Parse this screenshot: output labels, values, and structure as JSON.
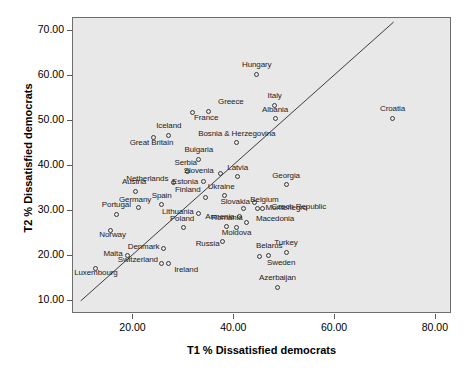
{
  "chart_data": {
    "type": "scatter",
    "title": "",
    "xlabel": "T1 % Dissatisfied democrats",
    "ylabel": "T2 % Dissatisfied democrats",
    "xlim": [
      8.0,
      83.2
    ],
    "ylim": [
      7.0,
      72.9
    ],
    "xticks": [
      20.0,
      40.0,
      60.0,
      80.0
    ],
    "yticks": [
      10.0,
      20.0,
      30.0,
      40.0,
      50.0,
      60.0,
      70.0
    ],
    "xtick_labels": [
      "20.00",
      "40.00",
      "60.00",
      "80.00"
    ],
    "ytick_labels": [
      "10.00",
      "20.00",
      "30.00",
      "40.00",
      "50.00",
      "60.00",
      "70.00"
    ],
    "grid": false,
    "legend": "none",
    "plot_background": "#e8e8e8",
    "marker_color": "#3a3a3a",
    "reference_line": {
      "type": "identity",
      "label": "y = x",
      "from": [
        9.5,
        9.5
      ],
      "to": [
        72.0,
        72.0
      ],
      "color": "#3a3a3a"
    },
    "points": [
      {
        "name": "Hungary",
        "x": 44.5,
        "y": 60.4,
        "label_dx": 0,
        "label_dy": -10,
        "label_align": "center"
      },
      {
        "name": "Italy",
        "x": 48.0,
        "y": 53.5,
        "label_dx": 0,
        "label_dy": -10,
        "label_align": "center"
      },
      {
        "name": "Greece",
        "x": 34.8,
        "y": 52.1,
        "label_dx": 6,
        "label_dy": -10,
        "label_align": "left"
      },
      {
        "name": "Albania",
        "x": 48.1,
        "y": 50.5,
        "label_dx": 0,
        "label_dy": -10,
        "label_align": "center"
      },
      {
        "name": "France",
        "x": 31.8,
        "y": 51.8,
        "label_dx": -3,
        "label_dy": 4,
        "label_align": "left"
      },
      {
        "name": "Croatia",
        "x": 71.4,
        "y": 50.6,
        "label_dx": 0,
        "label_dy": -10,
        "label_align": "center"
      },
      {
        "name": "Bosnia & Herzegovina",
        "x": 40.5,
        "y": 45.1,
        "label_dx": 0,
        "label_dy": -10,
        "label_align": "center"
      },
      {
        "name": "Iceland",
        "x": 27.0,
        "y": 46.8,
        "label_dx": 0,
        "label_dy": -10,
        "label_align": "center"
      },
      {
        "name": "Great Britain",
        "x": 24.0,
        "y": 46.2,
        "label_dx": -2,
        "label_dy": 4,
        "label_align": "center"
      },
      {
        "name": "Bulgaria",
        "x": 33.0,
        "y": 41.5,
        "label_dx": 0,
        "label_dy": -10,
        "label_align": "center"
      },
      {
        "name": "Serbia",
        "x": 30.8,
        "y": 38.7,
        "label_dx": -2,
        "label_dy": -10,
        "label_align": "center"
      },
      {
        "name": "Slovenia",
        "x": 37.3,
        "y": 38.2,
        "label_dx": -7,
        "label_dy": -4,
        "label_align": "right"
      },
      {
        "name": "Latvia",
        "x": 40.7,
        "y": 37.6,
        "label_dx": 0,
        "label_dy": -10,
        "label_align": "center"
      },
      {
        "name": "Netherlands",
        "x": 27.9,
        "y": 36.3,
        "label_dx": -5,
        "label_dy": -4,
        "label_align": "right"
      },
      {
        "name": "Estonia",
        "x": 33.8,
        "y": 36.4,
        "label_dx": -5,
        "label_dy": -1,
        "label_align": "right"
      },
      {
        "name": "Georgia",
        "x": 50.3,
        "y": 35.8,
        "label_dx": 0,
        "label_dy": -10,
        "label_align": "center"
      },
      {
        "name": "Austria",
        "x": 20.5,
        "y": 34.3,
        "label_dx": -2,
        "label_dy": -10,
        "label_align": "center"
      },
      {
        "name": "Finland",
        "x": 34.2,
        "y": 32.9,
        "label_dx": -4,
        "label_dy": -9,
        "label_align": "right"
      },
      {
        "name": "Ukraine",
        "x": 38.0,
        "y": 33.4,
        "label_dx": -3,
        "label_dy": -9,
        "label_align": "center"
      },
      {
        "name": "Slovakia",
        "x": 44.0,
        "y": 31.8,
        "label_dx": -5,
        "label_dy": -2,
        "label_align": "right"
      },
      {
        "name": "Czech Republic",
        "x": 45.6,
        "y": 30.4,
        "label_dx": 5,
        "label_dy": -3,
        "label_align": "left"
      },
      {
        "name": "Spain",
        "x": 25.6,
        "y": 31.3,
        "label_dx": 0,
        "label_dy": -10,
        "label_align": "center"
      },
      {
        "name": "Germany",
        "x": 20.9,
        "y": 30.7,
        "label_dx": -3,
        "label_dy": -9,
        "label_align": "center"
      },
      {
        "name": "Portugal",
        "x": 16.6,
        "y": 29.2,
        "label_dx": 0,
        "label_dy": -10,
        "label_align": "center"
      },
      {
        "name": "Belgium",
        "x": 41.8,
        "y": 30.4,
        "label_dx": 3,
        "label_dy": -10,
        "label_align": "left"
      },
      {
        "name": "Montenegro",
        "x": 44.6,
        "y": 30.4,
        "label_dx": 4,
        "label_dy": -2,
        "label_align": "left"
      },
      {
        "name": "Lithuania",
        "x": 33.0,
        "y": 29.4,
        "label_dx": -5,
        "label_dy": -2,
        "label_align": "right"
      },
      {
        "name": "Armenia",
        "x": 41.0,
        "y": 28.6,
        "label_dx": -5,
        "label_dy": -1,
        "label_align": "right"
      },
      {
        "name": "Macedonia",
        "x": 42.5,
        "y": 27.4,
        "label_dx": 5,
        "label_dy": -4,
        "label_align": "left"
      },
      {
        "name": "Romania",
        "x": 38.5,
        "y": 26.4,
        "label_dx": 0,
        "label_dy": -10,
        "label_align": "center"
      },
      {
        "name": "Poland",
        "x": 30.0,
        "y": 26.2,
        "label_dx": -2,
        "label_dy": -10,
        "label_align": "center"
      },
      {
        "name": "Norway",
        "x": 15.5,
        "y": 25.7,
        "label_dx": 2,
        "label_dy": 4,
        "label_align": "center"
      },
      {
        "name": "Moldova",
        "x": 40.5,
        "y": 26.2,
        "label_dx": 0,
        "label_dy": 4,
        "label_align": "center"
      },
      {
        "name": "Russia",
        "x": 37.7,
        "y": 23.1,
        "label_dx": -3,
        "label_dy": 1,
        "label_align": "right"
      },
      {
        "name": "Denmark",
        "x": 26.0,
        "y": 21.6,
        "label_dx": -4,
        "label_dy": -2,
        "label_align": "right"
      },
      {
        "name": "Turkey",
        "x": 50.3,
        "y": 20.8,
        "label_dx": 0,
        "label_dy": -10,
        "label_align": "center"
      },
      {
        "name": "Belarus",
        "x": 46.7,
        "y": 20.1,
        "label_dx": 1,
        "label_dy": -10,
        "label_align": "center"
      },
      {
        "name": "Malta",
        "x": 18.8,
        "y": 20.0,
        "label_dx": -5,
        "label_dy": -3,
        "label_align": "right"
      },
      {
        "name": "Sweden",
        "x": 45.1,
        "y": 19.8,
        "label_dx": 3,
        "label_dy": 5,
        "label_align": "left"
      },
      {
        "name": "Switzerland",
        "x": 25.6,
        "y": 18.2,
        "label_dx": -4,
        "label_dy": -5,
        "label_align": "right"
      },
      {
        "name": "Ireland",
        "x": 26.9,
        "y": 18.2,
        "label_dx": 2,
        "label_dy": 5,
        "label_align": "left"
      },
      {
        "name": "Luxembourg",
        "x": 12.5,
        "y": 17.2,
        "label_dx": 0,
        "label_dy": 4,
        "label_align": "center"
      },
      {
        "name": "Azerbaijan",
        "x": 48.6,
        "y": 13.0,
        "label_dx": 0,
        "label_dy": -10,
        "label_align": "center"
      }
    ]
  }
}
